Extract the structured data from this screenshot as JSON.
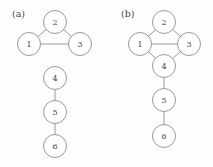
{
  "figure": {
    "background_color": "#fdfdfc",
    "stroke_color": "#8d8d8d",
    "node_fill_color": "#ffffff",
    "label_color": "#454545",
    "node_radius": 11.5
  },
  "panels": [
    {
      "id": "panel-a",
      "label": "(a)",
      "label_x": 12,
      "label_y": 17,
      "nodes": [
        {
          "id": "a1",
          "label": "1",
          "x": 29,
          "y": 44
        },
        {
          "id": "a2",
          "label": "2",
          "x": 55,
          "y": 22
        },
        {
          "id": "a3",
          "label": "3",
          "x": 80,
          "y": 44
        },
        {
          "id": "a4",
          "label": "4",
          "x": 55,
          "y": 78
        },
        {
          "id": "a5",
          "label": "5",
          "x": 55,
          "y": 112
        },
        {
          "id": "a6",
          "label": "6",
          "x": 55,
          "y": 146
        }
      ],
      "edges": [
        {
          "from": "a1",
          "to": "a2"
        },
        {
          "from": "a2",
          "to": "a3"
        },
        {
          "from": "a1",
          "to": "a3"
        },
        {
          "from": "a4",
          "to": "a5"
        },
        {
          "from": "a5",
          "to": "a6"
        }
      ]
    },
    {
      "id": "panel-b",
      "label": "(b)",
      "label_x": 121,
      "label_y": 17,
      "nodes": [
        {
          "id": "b1",
          "label": "1",
          "x": 140,
          "y": 44
        },
        {
          "id": "b2",
          "label": "2",
          "x": 164,
          "y": 22
        },
        {
          "id": "b3",
          "label": "3",
          "x": 189,
          "y": 44
        },
        {
          "id": "b4",
          "label": "4",
          "x": 164,
          "y": 66
        },
        {
          "id": "b5",
          "label": "5",
          "x": 164,
          "y": 100
        },
        {
          "id": "b6",
          "label": "6",
          "x": 164,
          "y": 136
        }
      ],
      "edges": [
        {
          "from": "b1",
          "to": "b2"
        },
        {
          "from": "b2",
          "to": "b3"
        },
        {
          "from": "b1",
          "to": "b3"
        },
        {
          "from": "b1",
          "to": "b4"
        },
        {
          "from": "b3",
          "to": "b4"
        },
        {
          "from": "b4",
          "to": "b5"
        },
        {
          "from": "b5",
          "to": "b6"
        }
      ]
    }
  ]
}
